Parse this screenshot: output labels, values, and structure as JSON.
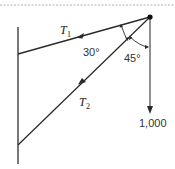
{
  "diagram": {
    "type": "force-diagram",
    "labels": {
      "t1_letter": "T",
      "t1_sub": "1",
      "t2_letter": "T",
      "t2_sub": "2",
      "angle1": "30°",
      "angle2": "45°",
      "weight": "1,000"
    },
    "colors": {
      "line": "#2a2a2a",
      "wall": "#555555",
      "dashed": "#999999"
    }
  }
}
